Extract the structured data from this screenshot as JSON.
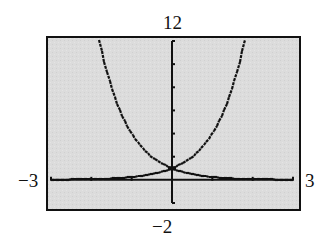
{
  "window_labels": {
    "ymax": "12",
    "ymin": "−2",
    "xmin": "−3",
    "xmax": "3"
  },
  "colors": {
    "screen_background": "#dadada",
    "frame": "#111111",
    "axis": "#111111",
    "curve": "#111111",
    "page_background": "#ffffff"
  },
  "chart_data": {
    "type": "line",
    "title": "",
    "xlabel": "",
    "ylabel": "",
    "xlim": [
      -3,
      3
    ],
    "ylim": [
      -2,
      12
    ],
    "xscl": 1,
    "yscl": 2,
    "grid": false,
    "legend": "none",
    "tick_labels": {
      "x_min": "-3",
      "x_max": "3",
      "y_min": "-2",
      "y_max": "12"
    },
    "series": [
      {
        "name": "y = 4^x",
        "x": [
          -3,
          -2.5,
          -2,
          -1.5,
          -1,
          -0.5,
          0,
          0.25,
          0.5,
          0.75,
          1,
          1.25,
          1.5,
          1.75,
          1.79
        ],
        "values": [
          0.016,
          0.031,
          0.063,
          0.125,
          0.25,
          0.5,
          1,
          1.41,
          2,
          2.83,
          4,
          5.66,
          8,
          11.31,
          12
        ]
      },
      {
        "name": "y = 4^(-x)",
        "x": [
          -1.79,
          -1.75,
          -1.5,
          -1.25,
          -1,
          -0.75,
          -0.5,
          -0.25,
          0,
          0.5,
          1,
          1.5,
          2,
          2.5,
          3
        ],
        "values": [
          12,
          11.31,
          8,
          5.66,
          4,
          2.83,
          2,
          1.41,
          1,
          0.5,
          0.25,
          0.125,
          0.063,
          0.031,
          0.016
        ]
      }
    ],
    "annotations": [
      {
        "text": "intersection",
        "x": 0,
        "y": 1
      }
    ]
  }
}
